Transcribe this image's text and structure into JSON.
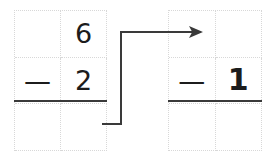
{
  "worksheet": {
    "title": "Subtraction regrouping step",
    "background_color": "#ffffff",
    "ink_color": "#1c1c1c",
    "rule_color": "#3a3a3a",
    "grid_line_color": "#d8d8d8"
  },
  "left_problem": {
    "name": "minuend-subtrahend-block",
    "cells": [
      {
        "row": 1,
        "col": 1,
        "text": ""
      },
      {
        "row": 1,
        "col": 2,
        "text": "6"
      },
      {
        "row": 2,
        "col": 1,
        "text": "—"
      },
      {
        "row": 2,
        "col": 2,
        "text": "2"
      },
      {
        "row": 3,
        "col": 1,
        "text": ""
      },
      {
        "row": 3,
        "col": 2,
        "text": ""
      }
    ],
    "top_digit": "6",
    "operator": "—",
    "bottom_digit": "2",
    "has_answer_rule": true
  },
  "right_problem": {
    "name": "regrouped-block",
    "cells": [
      {
        "row": 1,
        "col": 1,
        "text": ""
      },
      {
        "row": 1,
        "col": 2,
        "text": ""
      },
      {
        "row": 2,
        "col": 1,
        "text": "—"
      },
      {
        "row": 2,
        "col": 2,
        "text": "1"
      },
      {
        "row": 3,
        "col": 1,
        "text": ""
      },
      {
        "row": 3,
        "col": 2,
        "text": ""
      }
    ],
    "top_digit": "",
    "operator": "—",
    "bottom_digit": "1",
    "has_answer_rule": true
  },
  "arrow": {
    "name": "regroup-arrow",
    "label": "",
    "color": "#3a3a3a",
    "direction": "right",
    "path_points": "102,124 121,124 121,32 202,32"
  }
}
